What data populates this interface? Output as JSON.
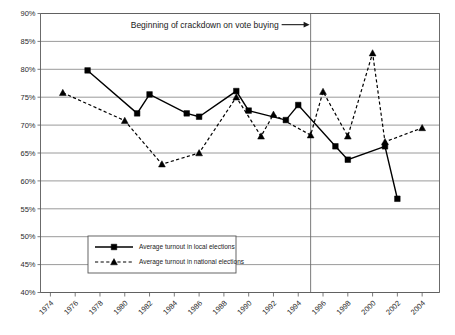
{
  "chart_data": {
    "type": "line",
    "title": "",
    "subtitle": "",
    "xlabel": "",
    "ylabel": "",
    "ylim": [
      40,
      90
    ],
    "ytick_step": 5,
    "ytick_labels": [
      "90%",
      "85%",
      "80%",
      "75%",
      "70%",
      "65%",
      "60%",
      "55%",
      "50%",
      "45%",
      "40%"
    ],
    "ytick_values": [
      90,
      85,
      80,
      75,
      70,
      65,
      60,
      55,
      50,
      45,
      40
    ],
    "xlim": [
      1973.2,
      2005.4
    ],
    "xtick_labels": [
      "1974",
      "1976",
      "1978",
      "1980",
      "1982",
      "1984",
      "1986",
      "1988",
      "1990",
      "1992",
      "1994",
      "1996",
      "1998",
      "2000",
      "2002",
      "2004"
    ],
    "xtick_values": [
      1974,
      1976,
      1978,
      1980,
      1982,
      1984,
      1986,
      1988,
      1990,
      1992,
      1994,
      1996,
      1998,
      2000,
      2002,
      2004
    ],
    "grid": "horizontal",
    "legend_position": "lower-left-inside",
    "value_suffix": "%",
    "series": [
      {
        "name": "Average turnout in local elections",
        "key": "local",
        "style": "solid",
        "marker": "square",
        "color": "#000000",
        "points": [
          {
            "x": 1977,
            "y": 79.8
          },
          {
            "x": 1981,
            "y": 72.1
          },
          {
            "x": 1982,
            "y": 75.5
          },
          {
            "x": 1985,
            "y": 72.1
          },
          {
            "x": 1986,
            "y": 71.5
          },
          {
            "x": 1989,
            "y": 76.1
          },
          {
            "x": 1990,
            "y": 72.6
          },
          {
            "x": 1993,
            "y": 70.9
          },
          {
            "x": 1994,
            "y": 73.6
          },
          {
            "x": 1997,
            "y": 66.2
          },
          {
            "x": 1998,
            "y": 63.8
          },
          {
            "x": 2001,
            "y": 66.2
          },
          {
            "x": 2002,
            "y": 56.8
          }
        ]
      },
      {
        "name": "Average turnout in national elections",
        "key": "national",
        "style": "dashed",
        "marker": "triangle",
        "color": "#000000",
        "points": [
          {
            "x": 1975,
            "y": 75.8
          },
          {
            "x": 1980,
            "y": 70.8
          },
          {
            "x": 1983,
            "y": 63.0
          },
          {
            "x": 1986,
            "y": 65.0
          },
          {
            "x": 1989,
            "y": 75.0
          },
          {
            "x": 1991,
            "y": 68.0
          },
          {
            "x": 1992,
            "y": 71.9
          },
          {
            "x": 1995,
            "y": 68.2
          },
          {
            "x": 1996,
            "y": 76.0
          },
          {
            "x": 1998,
            "y": 68.0
          },
          {
            "x": 2000,
            "y": 82.9
          },
          {
            "x": 2001,
            "y": 67.0
          },
          {
            "x": 2004,
            "y": 69.5
          }
        ]
      }
    ],
    "annotations": [
      {
        "name": "crackdown-annotation",
        "text": "Beginning of crackdown on vote buying",
        "arrow": "right",
        "marker_line_x": 1995,
        "label_y": 88.0
      }
    ]
  },
  "legend": {
    "items": [
      {
        "label": "Average turnout in local elections",
        "style": "solid",
        "marker": "square"
      },
      {
        "label": "Average turnout in national elections",
        "style": "dashed",
        "marker": "triangle"
      }
    ]
  }
}
